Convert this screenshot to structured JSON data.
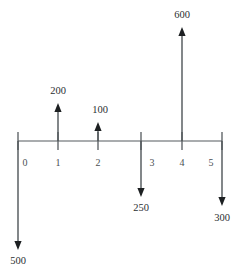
{
  "diagram": {
    "type": "cash-flow-timeline",
    "title": "",
    "axis": {
      "orientation": "horizontal",
      "x_start": 18,
      "x_end": 222,
      "y": 141,
      "tick_half_up": 9,
      "tick_half_down": 9,
      "period_labels": [
        "0",
        "1",
        "2",
        "3",
        "4",
        "5"
      ],
      "period_label_y": 164,
      "period_positions_px": [
        18,
        58,
        98,
        141,
        182,
        222
      ],
      "period_label_positions_px": [
        25,
        58,
        98,
        152,
        182,
        211
      ]
    },
    "ticks": [
      {
        "period": "0",
        "x": 18,
        "label": "0",
        "label_x": 25
      },
      {
        "period": "1",
        "x": 58,
        "label": "1",
        "label_x": 58
      },
      {
        "period": "2",
        "x": 98,
        "label": "2",
        "label_x": 98
      },
      {
        "period": "3",
        "x": 141,
        "label": "3",
        "label_x": 152
      },
      {
        "period": "4",
        "x": 182,
        "label": "4",
        "label_x": 182
      },
      {
        "period": "5",
        "x": 222,
        "label": "5",
        "label_x": 211
      }
    ],
    "flows": [
      {
        "id": "flow-t0",
        "period": "0",
        "x": 18,
        "direction": "down",
        "amount": "500",
        "sign": "negative",
        "tip_y": 250,
        "label_x": 18,
        "label_y": 262
      },
      {
        "id": "flow-t1",
        "period": "1",
        "x": 58,
        "direction": "up",
        "amount": "200",
        "sign": "positive",
        "tip_y": 103,
        "label_x": 58,
        "label_y": 92
      },
      {
        "id": "flow-t2",
        "period": "2",
        "x": 98,
        "direction": "up",
        "amount": "100",
        "sign": "positive",
        "tip_y": 122,
        "label_x": 100,
        "label_y": 111
      },
      {
        "id": "flow-t3",
        "period": "3",
        "x": 141,
        "direction": "down",
        "amount": "250",
        "sign": "negative",
        "tip_y": 197,
        "label_x": 141,
        "label_y": 209
      },
      {
        "id": "flow-t4",
        "period": "4",
        "x": 182,
        "direction": "up",
        "amount": "600",
        "sign": "positive",
        "tip_y": 27,
        "label_x": 182,
        "label_y": 16
      },
      {
        "id": "flow-t5",
        "period": "5",
        "x": 222,
        "direction": "down",
        "amount": "300",
        "sign": "negative",
        "tip_y": 206,
        "label_x": 222,
        "label_y": 219
      }
    ],
    "colors": {
      "axis": "#555a5e",
      "arrow_shaft": "#4e5458",
      "arrow_head": "#1d2022",
      "tick_text": "#4a4f53",
      "value_text": "#2b2f32",
      "background": "#ffffff"
    }
  }
}
